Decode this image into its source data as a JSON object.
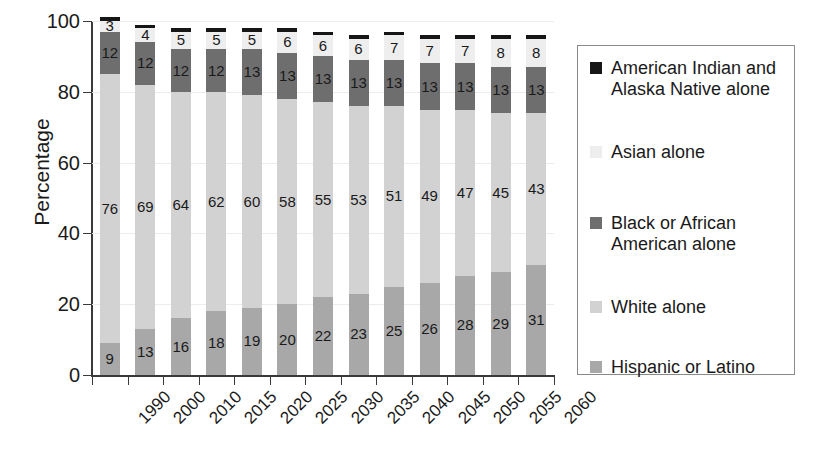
{
  "chart_data": {
    "type": "bar",
    "stacked": true,
    "title": "",
    "xlabel": "",
    "ylabel": "Percentage",
    "ylim": [
      0,
      100
    ],
    "yticks": [
      0,
      20,
      40,
      60,
      80,
      100
    ],
    "grid": true,
    "legend_position": "right",
    "categories": [
      "1990",
      "2000",
      "2010",
      "2015",
      "2020",
      "2025",
      "2030",
      "2035",
      "2040",
      "2045",
      "2050",
      "2055",
      "2060"
    ],
    "series": [
      {
        "name": "Hispanic or Latino",
        "color": "#a8a8a8",
        "values": [
          9,
          13,
          16,
          18,
          19,
          20,
          22,
          23,
          25,
          26,
          28,
          29,
          31
        ],
        "labels": [
          "9",
          "13",
          "16",
          "18",
          "19",
          "20",
          "22",
          "23",
          "25",
          "26",
          "28",
          "29",
          "31"
        ]
      },
      {
        "name": "White alone",
        "color": "#d2d2d2",
        "values": [
          76,
          69,
          64,
          62,
          60,
          58,
          55,
          53,
          51,
          49,
          47,
          45,
          43
        ],
        "labels": [
          "76",
          "69",
          "64",
          "62",
          "60",
          "58",
          "55",
          "53",
          "51",
          "49",
          "47",
          "45",
          "43"
        ]
      },
      {
        "name": "Black or African American alone",
        "color": "#6e6e6e",
        "values": [
          12,
          12,
          12,
          12,
          13,
          13,
          13,
          13,
          13,
          13,
          13,
          13,
          13
        ],
        "labels": [
          "12",
          "12",
          "12",
          "12",
          "13",
          "13",
          "13",
          "13",
          "13",
          "13",
          "13",
          "13",
          "13"
        ]
      },
      {
        "name": "Asian alone",
        "color": "#eeeeee",
        "values": [
          3,
          4,
          5,
          5,
          5,
          6,
          6,
          6,
          7,
          7,
          7,
          8,
          8
        ],
        "labels": [
          "3",
          "4",
          "5",
          "5",
          "5",
          "6",
          "6",
          "6",
          "7",
          "7",
          "7",
          "8",
          "8"
        ]
      },
      {
        "name": "American Indian and Alaska Native alone",
        "color": "#161616",
        "values": [
          1,
          1,
          1,
          1,
          1,
          1,
          1,
          1,
          1,
          1,
          1,
          1,
          1
        ],
        "labels": [
          "",
          "",
          "",
          "",
          "",
          "",
          "",
          "",
          "",
          "",
          "",
          "",
          ""
        ]
      }
    ]
  },
  "axes": {
    "y_title": "Percentage",
    "y_ticks": [
      "100",
      "80",
      "60",
      "40",
      "20",
      "0"
    ],
    "x_ticks": [
      "1990",
      "2000",
      "2010",
      "2015",
      "2020",
      "2025",
      "2030",
      "2035",
      "2040",
      "2045",
      "2050",
      "2055",
      "2060"
    ]
  },
  "legend": {
    "items": [
      {
        "label": "American Indian and Alaska Native alone",
        "color": "#161616"
      },
      {
        "label": "Asian alone",
        "color": "#eeeeee"
      },
      {
        "label": "Black or African American alone",
        "color": "#6e6e6e"
      },
      {
        "label": "White alone",
        "color": "#d2d2d2"
      },
      {
        "label": "Hispanic or Latino",
        "color": "#a8a8a8"
      }
    ]
  }
}
